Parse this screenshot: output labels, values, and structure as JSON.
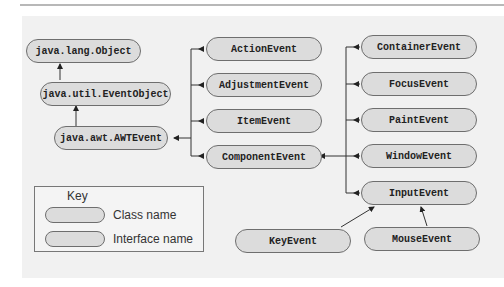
{
  "diagram": {
    "title": "",
    "colors": {
      "node_fill": "#dcdcdc",
      "node_border": "#6e6e6e",
      "background": "#f1f1f1",
      "line": "#333333"
    },
    "nodes": {
      "object": "java.lang.Object",
      "event_object": "java.util.EventObject",
      "awt_event": "java.awt.AWTEvent",
      "action_event": "ActionEvent",
      "adjustment_event": "AdjustmentEvent",
      "item_event": "ItemEvent",
      "component_event": "ComponentEvent",
      "container_event": "ContainerEvent",
      "focus_event": "FocusEvent",
      "paint_event": "PaintEvent",
      "window_event": "WindowEvent",
      "input_event": "InputEvent",
      "key_event": "KeyEvent",
      "mouse_event": "MouseEvent"
    },
    "edges": [
      [
        "java.util.EventObject",
        "java.lang.Object"
      ],
      [
        "java.awt.AWTEvent",
        "java.util.EventObject"
      ],
      [
        "ActionEvent",
        "java.awt.AWTEvent"
      ],
      [
        "AdjustmentEvent",
        "java.awt.AWTEvent"
      ],
      [
        "ItemEvent",
        "java.awt.AWTEvent"
      ],
      [
        "ComponentEvent",
        "java.awt.AWTEvent"
      ],
      [
        "ContainerEvent",
        "ComponentEvent"
      ],
      [
        "FocusEvent",
        "ComponentEvent"
      ],
      [
        "PaintEvent",
        "ComponentEvent"
      ],
      [
        "WindowEvent",
        "ComponentEvent"
      ],
      [
        "InputEvent",
        "ComponentEvent"
      ],
      [
        "KeyEvent",
        "InputEvent"
      ],
      [
        "MouseEvent",
        "InputEvent"
      ]
    ],
    "key": {
      "title": "Key",
      "class_label": "Class name",
      "interface_label": "Interface name"
    }
  }
}
